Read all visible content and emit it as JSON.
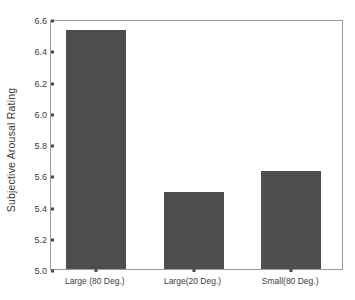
{
  "chart_data": {
    "type": "bar",
    "title": "",
    "xlabel": "",
    "ylabel": "Subjective Arousal Rating",
    "categories": [
      "Large (80 Deg.)",
      "Large(20 Deg.)",
      "Small(80 Deg.)"
    ],
    "values": [
      6.53,
      5.49,
      5.63
    ],
    "ylim": [
      5.0,
      6.6
    ],
    "ytick_labels": [
      "5.0",
      "5.2",
      "5.4",
      "5.6",
      "5.8",
      "6.0",
      "6.2",
      "6.4",
      "6.6"
    ],
    "ytick_values": [
      5.0,
      5.2,
      5.4,
      5.6,
      5.8,
      6.0,
      6.2,
      6.4,
      6.6
    ],
    "grid": false,
    "legend": null,
    "bar_color": "#4a4a4a",
    "frame_color": "#9a9a9a",
    "background_color": "#ffffff"
  }
}
